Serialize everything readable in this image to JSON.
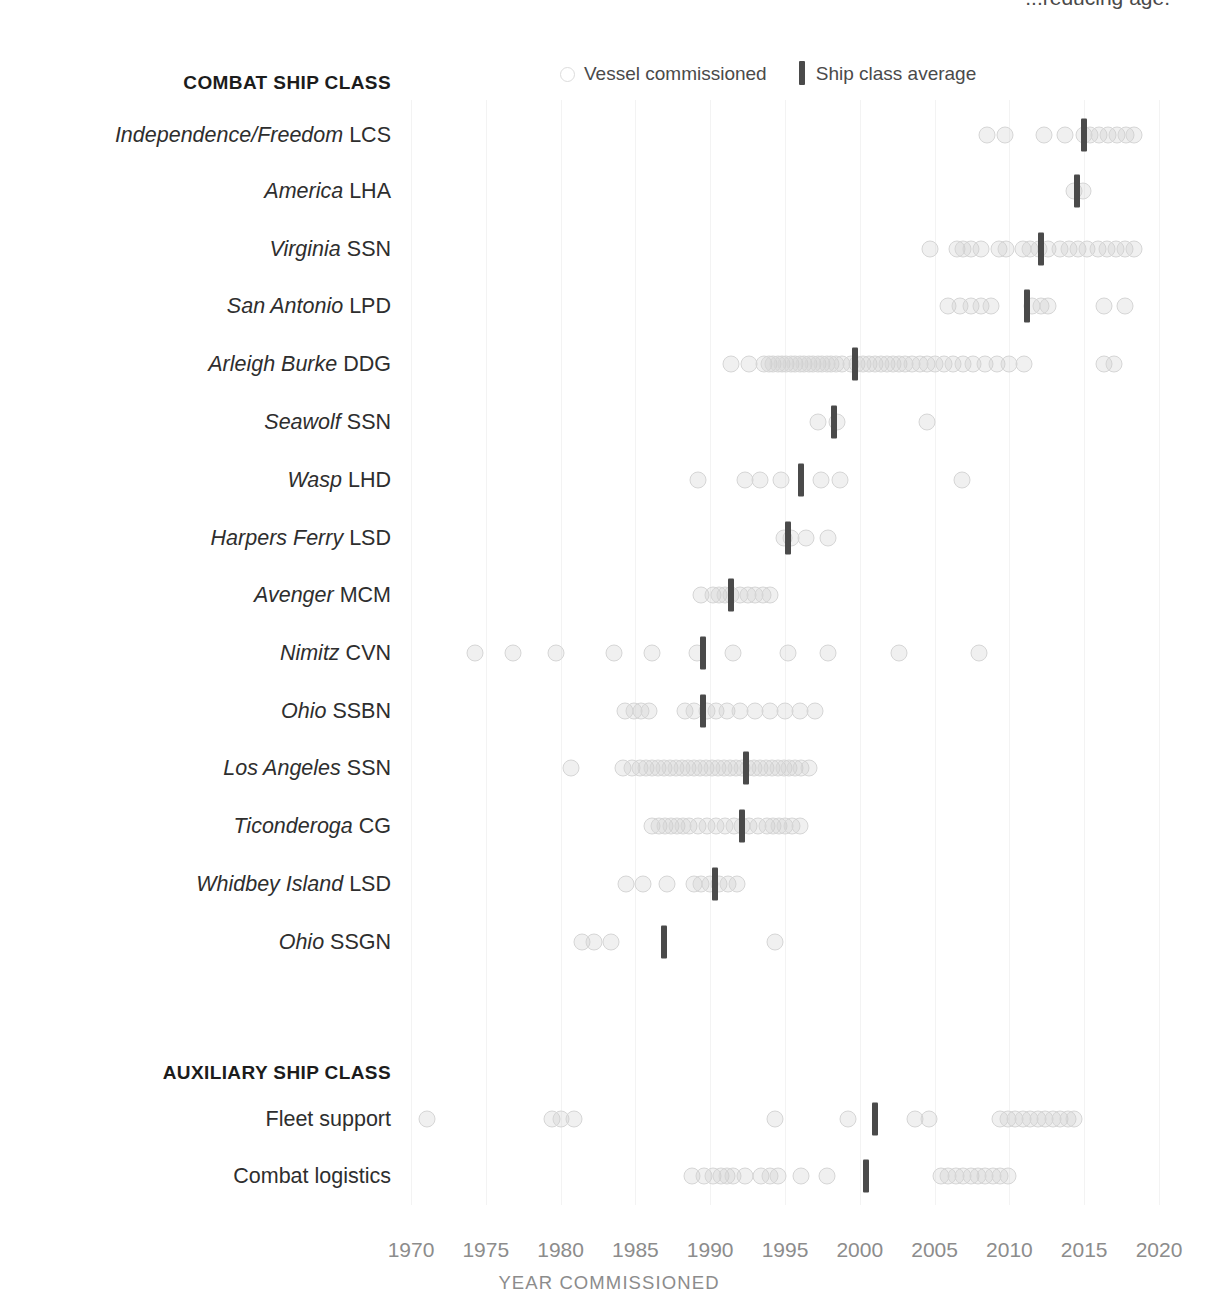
{
  "caption_clipped": "...reducing age.",
  "legend": {
    "items": [
      {
        "label": "Vessel commissioned",
        "marker": "open-circle-icon"
      },
      {
        "label": "Ship class average",
        "marker": "vertical-bar-icon"
      }
    ]
  },
  "axis": {
    "title": "YEAR COMMISSIONED",
    "ticks": [
      "1970",
      "1975",
      "1980",
      "1985",
      "1990",
      "1995",
      "2000",
      "2005",
      "2010",
      "2015",
      "2020"
    ]
  },
  "sections": [
    {
      "id": "combat",
      "header": "COMBAT SHIP CLASS"
    },
    {
      "id": "auxiliary",
      "header": "AUXILIARY SHIP CLASS"
    }
  ],
  "colors": {
    "dot_stroke": "#d6d6d6",
    "avg_bar": "#4a4a4a",
    "gridline": "#f3f3f3",
    "label_text": "#2e2e2e",
    "tick_text": "#8c8c8c"
  },
  "chart_data": {
    "type": "scatter",
    "title": "",
    "xlabel": "YEAR COMMISSIONED",
    "ylabel": "",
    "xlim": [
      1968,
      2021
    ],
    "grid": "vertical",
    "legend_position": "top",
    "rows": [
      {
        "section": "combat",
        "class_name": "Independence/Freedom",
        "designation": "LCS",
        "average": 2015.0,
        "values": [
          2008.5,
          2009.7,
          2012.3,
          2013.7,
          2015.0,
          2015.4,
          2016.0,
          2016.6,
          2017.2,
          2017.8,
          2018.3
        ]
      },
      {
        "section": "combat",
        "class_name": "America",
        "designation": "LHA",
        "average": 2014.5,
        "values": [
          2014.3,
          2014.9
        ]
      },
      {
        "section": "combat",
        "class_name": "Virginia",
        "designation": "SSN",
        "average": 2012.1,
        "values": [
          2004.7,
          2006.5,
          2006.9,
          2007.4,
          2008.1,
          2009.3,
          2009.8,
          2010.9,
          2011.4,
          2012.0,
          2012.6,
          2013.4,
          2014.0,
          2014.6,
          2015.2,
          2015.9,
          2016.5,
          2017.1,
          2017.7,
          2018.3
        ]
      },
      {
        "section": "combat",
        "class_name": "San Antonio",
        "designation": "LPD",
        "average": 2011.2,
        "values": [
          2005.9,
          2006.7,
          2007.4,
          2008.1,
          2008.8,
          2011.5,
          2012.1,
          2012.6,
          2016.3,
          2017.7
        ]
      },
      {
        "section": "combat",
        "class_name": "Arleigh Burke",
        "designation": "DDG",
        "average": 1999.7,
        "values": [
          1991.4,
          1992.6,
          1993.6,
          1993.9,
          1994.2,
          1994.5,
          1994.8,
          1995.1,
          1995.4,
          1995.7,
          1996.0,
          1996.3,
          1996.6,
          1996.9,
          1997.2,
          1997.5,
          1997.8,
          1998.1,
          1998.4,
          1998.8,
          1999.4,
          1999.8,
          2000.2,
          2000.6,
          2001.0,
          2001.4,
          2001.8,
          2002.2,
          2002.6,
          2003.0,
          2003.5,
          2004.0,
          2004.5,
          2005.0,
          2005.6,
          2006.2,
          2006.9,
          2007.6,
          2008.4,
          2009.2,
          2010.0,
          2011.0,
          2016.3,
          2017.0
        ]
      },
      {
        "section": "combat",
        "class_name": "Seawolf",
        "designation": "SSN",
        "average": 1998.3,
        "values": [
          1997.2,
          1998.5,
          2004.5
        ]
      },
      {
        "section": "combat",
        "class_name": "Wasp",
        "designation": "LHD",
        "average": 1996.1,
        "values": [
          1989.2,
          1992.3,
          1993.3,
          1994.7,
          1997.4,
          1998.7,
          2006.8
        ]
      },
      {
        "section": "combat",
        "class_name": "Harpers Ferry",
        "designation": "LSD",
        "average": 1995.2,
        "values": [
          1994.9,
          1995.4,
          1996.4,
          1997.9
        ]
      },
      {
        "section": "combat",
        "class_name": "Avenger",
        "designation": "MCM",
        "average": 1991.4,
        "values": [
          1989.4,
          1990.2,
          1990.6,
          1991.0,
          1991.4,
          1992.0,
          1992.5,
          1993.0,
          1993.5,
          1994.0
        ]
      },
      {
        "section": "combat",
        "class_name": "Nimitz",
        "designation": "CVN",
        "average": 1989.5,
        "values": [
          1974.3,
          1976.8,
          1979.7,
          1983.6,
          1986.1,
          1989.1,
          1991.5,
          1995.2,
          1997.9,
          2002.6,
          2008.0
        ]
      },
      {
        "section": "combat",
        "class_name": "Ohio",
        "designation": "SSBN",
        "average": 1989.5,
        "values": [
          1984.3,
          1984.9,
          1985.4,
          1985.9,
          1988.3,
          1988.9,
          1989.8,
          1990.4,
          1991.1,
          1992.0,
          1993.0,
          1994.0,
          1995.0,
          1996.0,
          1997.0
        ]
      },
      {
        "section": "combat",
        "class_name": "Los Angeles",
        "designation": "SSN",
        "average": 1992.4,
        "values": [
          1980.7,
          1984.2,
          1984.8,
          1985.3,
          1985.7,
          1986.1,
          1986.5,
          1986.9,
          1987.3,
          1987.7,
          1988.1,
          1988.5,
          1988.9,
          1989.3,
          1989.7,
          1990.1,
          1990.5,
          1990.9,
          1991.3,
          1991.7,
          1992.1,
          1992.5,
          1992.9,
          1993.3,
          1993.7,
          1994.1,
          1994.5,
          1994.9,
          1995.3,
          1995.7,
          1996.1,
          1996.6
        ]
      },
      {
        "section": "combat",
        "class_name": "Ticonderoga",
        "designation": "CG",
        "average": 1992.1,
        "values": [
          1986.1,
          1986.6,
          1987.0,
          1987.4,
          1987.8,
          1988.2,
          1988.6,
          1989.2,
          1989.8,
          1990.4,
          1991.0,
          1991.6,
          1992.1,
          1992.6,
          1993.2,
          1993.8,
          1994.2,
          1994.6,
          1995.0,
          1995.5,
          1996.0
        ]
      },
      {
        "section": "combat",
        "class_name": "Whidbey Island",
        "designation": "LSD",
        "average": 1990.3,
        "values": [
          1984.4,
          1985.5,
          1987.1,
          1988.9,
          1989.4,
          1990.0,
          1990.6,
          1991.2,
          1991.8
        ]
      },
      {
        "section": "combat",
        "class_name": "Ohio",
        "designation": "SSGN",
        "average": 1986.9,
        "values": [
          1981.4,
          1982.2,
          1983.4,
          1994.3
        ]
      },
      {
        "section": "auxiliary",
        "class_name": "Fleet support",
        "designation": "",
        "italic": false,
        "average": 2001.0,
        "values": [
          1971.1,
          1979.4,
          1980.0,
          1980.9,
          1994.3,
          1999.2,
          2003.7,
          2004.6,
          2009.4,
          2009.9,
          2010.4,
          2010.9,
          2011.4,
          2011.9,
          2012.4,
          2012.9,
          2013.4,
          2013.9,
          2014.3
        ]
      },
      {
        "section": "auxiliary",
        "class_name": "Combat logistics",
        "designation": "",
        "italic": false,
        "average": 2000.4,
        "values": [
          1988.8,
          1989.6,
          1990.2,
          1990.7,
          1991.1,
          1991.5,
          1992.3,
          1993.4,
          1994.0,
          1994.5,
          1996.1,
          1997.8,
          2005.4,
          2005.9,
          2006.4,
          2006.9,
          2007.4,
          2007.9,
          2008.4,
          2008.9,
          2009.4,
          2009.9
        ]
      }
    ]
  }
}
